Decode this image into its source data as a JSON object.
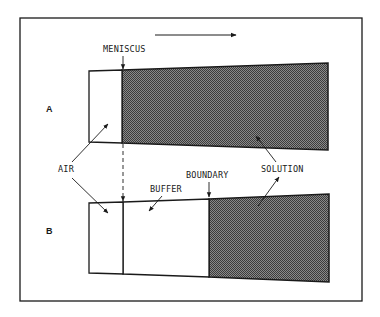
{
  "figure": {
    "direction_arrow": {
      "meaning": "centrifugal direction",
      "icon": "right-arrow-icon"
    },
    "panels": [
      {
        "id": "A",
        "label": "A"
      },
      {
        "id": "B",
        "label": "B"
      }
    ],
    "labels": {
      "meniscus": "MENISCUS",
      "air": "AIR",
      "buffer": "BUFFER",
      "boundary": "BOUNDARY",
      "solution": "SOLUTION"
    },
    "colors": {
      "line": "#1a1a1a",
      "solution_fill": "#6e6e6e",
      "background": "#ffffff"
    }
  }
}
